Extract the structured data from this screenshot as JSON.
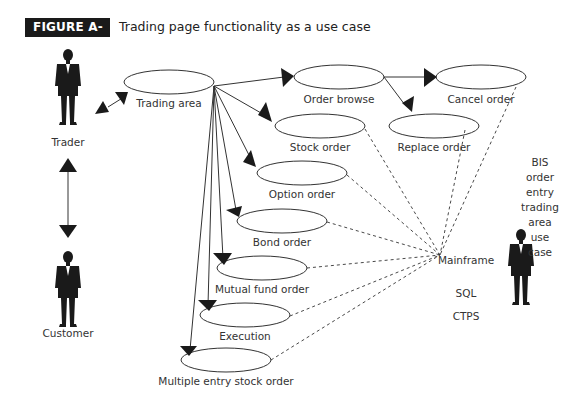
{
  "figure": {
    "badge": "FIGURE A-6",
    "title": "Trading page functionality as a use case"
  },
  "actors": {
    "trader": "Trader",
    "customer": "Customer"
  },
  "use_cases": {
    "trading_area": "Trading area",
    "order_browse": "Order browse",
    "cancel_order": "Cancel order",
    "replace_order": "Replace order",
    "stock_order": "Stock order",
    "option_order": "Option order",
    "bond_order": "Bond order",
    "mutual_fund_order": "Mutual fund order",
    "execution": "Execution",
    "multiple_entry_stock_order": "Multiple entry stock order"
  },
  "system": {
    "mainframe": "Mainframe",
    "sql": "SQL",
    "ctps": "CTPS"
  },
  "note": {
    "line1": "BIS order entry",
    "line2": "trading area",
    "line3": "use case"
  },
  "colors": {
    "badge_bg": "#1a1a1a",
    "line": "#333333"
  }
}
